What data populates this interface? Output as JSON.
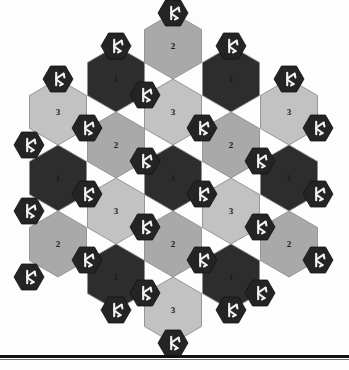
{
  "figure": {
    "type": "hex-board-diagram",
    "title": "",
    "colors": {
      "background": "#fdfdfd",
      "tile_dark": "#2d2d2d",
      "tile_medium": "#a9a9a9",
      "tile_light": "#c2c2c2",
      "tile_border": "#8e8e8e",
      "node_fill": "#242424",
      "node_glyph": "#f2f2f2",
      "rule": "#121212",
      "number_color": "#1b1b1b"
    },
    "geometry": {
      "tile_width": 57,
      "tile_height": 66,
      "node_radius": 15,
      "board_left": 18,
      "board_top": 8
    },
    "legend": {
      "value_1": "dark tile",
      "value_2": "medium gray tile",
      "value_3": "light gray tile",
      "node": "trident-token"
    }
  },
  "board": {
    "tiles": [
      {
        "id": "t1",
        "label": "2",
        "shade": "medium",
        "cx": 173,
        "cy": 46
      },
      {
        "id": "t2",
        "label": "1",
        "shade": "dark",
        "cx": 116,
        "cy": 79
      },
      {
        "id": "t3",
        "label": "1",
        "shade": "dark",
        "cx": 231,
        "cy": 79
      },
      {
        "id": "t4",
        "label": "3",
        "shade": "light",
        "cx": 58,
        "cy": 112
      },
      {
        "id": "t5",
        "label": "3",
        "shade": "light",
        "cx": 173,
        "cy": 112
      },
      {
        "id": "t6",
        "label": "3",
        "shade": "light",
        "cx": 289,
        "cy": 112
      },
      {
        "id": "t7",
        "label": "2",
        "shade": "medium",
        "cx": 116,
        "cy": 145
      },
      {
        "id": "t8",
        "label": "2",
        "shade": "medium",
        "cx": 231,
        "cy": 145
      },
      {
        "id": "t9",
        "label": "1",
        "shade": "dark",
        "cx": 58,
        "cy": 178
      },
      {
        "id": "t10",
        "label": "1",
        "shade": "dark",
        "cx": 173,
        "cy": 178
      },
      {
        "id": "t11",
        "label": "1",
        "shade": "dark",
        "cx": 289,
        "cy": 178
      },
      {
        "id": "t12",
        "label": "3",
        "shade": "light",
        "cx": 116,
        "cy": 211
      },
      {
        "id": "t13",
        "label": "3",
        "shade": "light",
        "cx": 231,
        "cy": 211
      },
      {
        "id": "t14",
        "label": "2",
        "shade": "medium",
        "cx": 58,
        "cy": 244
      },
      {
        "id": "t15",
        "label": "2",
        "shade": "medium",
        "cx": 173,
        "cy": 244
      },
      {
        "id": "t16",
        "label": "2",
        "shade": "medium",
        "cx": 289,
        "cy": 244
      },
      {
        "id": "t17",
        "label": "1",
        "shade": "dark",
        "cx": 116,
        "cy": 277
      },
      {
        "id": "t18",
        "label": "1",
        "shade": "dark",
        "cx": 231,
        "cy": 277
      },
      {
        "id": "t19",
        "label": "3",
        "shade": "light",
        "cx": 173,
        "cy": 310
      }
    ],
    "nodes": [
      {
        "id": "n1",
        "cx": 173,
        "cy": 13
      },
      {
        "id": "n2",
        "cx": 116,
        "cy": 46
      },
      {
        "id": "n3",
        "cx": 231,
        "cy": 46
      },
      {
        "id": "n4",
        "cx": 58,
        "cy": 79
      },
      {
        "id": "n5",
        "cx": 145,
        "cy": 95
      },
      {
        "id": "n6",
        "cx": 289,
        "cy": 79
      },
      {
        "id": "n7",
        "cx": 87,
        "cy": 128
      },
      {
        "id": "n8",
        "cx": 202,
        "cy": 128
      },
      {
        "id": "n9",
        "cx": 318,
        "cy": 128
      },
      {
        "id": "n10",
        "cx": 29,
        "cy": 145
      },
      {
        "id": "n11",
        "cx": 145,
        "cy": 161
      },
      {
        "id": "n12",
        "cx": 260,
        "cy": 161
      },
      {
        "id": "n13",
        "cx": 87,
        "cy": 194
      },
      {
        "id": "n14",
        "cx": 202,
        "cy": 194
      },
      {
        "id": "n15",
        "cx": 318,
        "cy": 194
      },
      {
        "id": "n16",
        "cx": 29,
        "cy": 211
      },
      {
        "id": "n17",
        "cx": 145,
        "cy": 227
      },
      {
        "id": "n18",
        "cx": 260,
        "cy": 227
      },
      {
        "id": "n19",
        "cx": 87,
        "cy": 260
      },
      {
        "id": "n20",
        "cx": 202,
        "cy": 260
      },
      {
        "id": "n21",
        "cx": 318,
        "cy": 260
      },
      {
        "id": "n22",
        "cx": 29,
        "cy": 277
      },
      {
        "id": "n23",
        "cx": 145,
        "cy": 293
      },
      {
        "id": "n24",
        "cx": 260,
        "cy": 293
      },
      {
        "id": "n25",
        "cx": 116,
        "cy": 310
      },
      {
        "id": "n26",
        "cx": 231,
        "cy": 310
      },
      {
        "id": "n27",
        "cx": 173,
        "cy": 343
      }
    ]
  },
  "chart_data": {
    "type": "table",
    "categories": [
      "1",
      "2",
      "3"
    ],
    "values": [
      7,
      6,
      6
    ],
    "xlabel": "tile value",
    "ylabel": "count"
  }
}
